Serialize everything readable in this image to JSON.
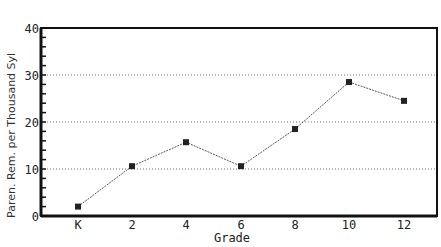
{
  "chart_data": {
    "type": "line",
    "title": "",
    "xlabel": "Grade",
    "ylabel": "Paren. Rem. per Thousand Syl",
    "categories": [
      "K",
      "2",
      "4",
      "6",
      "8",
      "10",
      "12"
    ],
    "series": [
      {
        "name": "Parenthetical Remarks per Thousand Syllables",
        "values": [
          2,
          10.6,
          15.7,
          10.6,
          18.5,
          28.5,
          24.5
        ]
      }
    ],
    "ylim": [
      0,
      40
    ],
    "yticks": [
      "0",
      "10",
      "20",
      "30",
      "40"
    ],
    "grid": "horizontal dotted at 10, 20, 30",
    "legend": "none",
    "marker": "square",
    "colors": {
      "line": "#555555",
      "marker": "#222222",
      "axis": "#111111",
      "grid": "#777777"
    }
  },
  "axes": {
    "xlabel": "Grade",
    "ylabel": "Paren. Rem. per Thousand Syl",
    "xticks": [
      "K",
      "2",
      "4",
      "6",
      "8",
      "10",
      "12"
    ],
    "yticks": [
      "0",
      "10",
      "20",
      "30",
      "40"
    ]
  }
}
